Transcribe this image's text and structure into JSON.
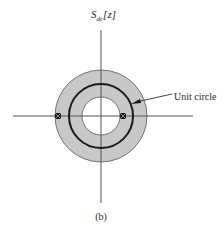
{
  "figure": {
    "title_main": "S",
    "title_sub": "dc",
    "title_arg": "[z]",
    "caption": "(b)",
    "annotation": "Unit circle"
  },
  "diagram": {
    "type": "z-plane pole plot",
    "center": [
      101,
      116
    ],
    "outer_radius": 46,
    "unit_circle_radius": 32,
    "inner_radius": 19,
    "region_of_convergence_color": "#c8c8c8",
    "axis_color": "#555555",
    "unit_circle_color": "#1a1a1a",
    "poles": [
      {
        "label": "pole-left",
        "x": 58,
        "y": 116
      },
      {
        "label": "pole-right",
        "x": 123,
        "y": 116
      }
    ]
  }
}
